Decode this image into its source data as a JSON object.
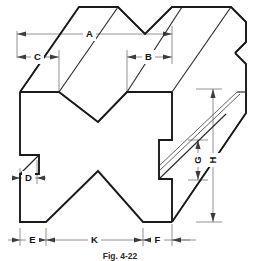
{
  "figure": {
    "kind": "isometric-technical-drawing",
    "caption": "Fig. 4-22",
    "colors": {
      "outline": "#1a1a1a",
      "interior_edge": "#2b2b2b",
      "dimension_line": "#6f6f6f",
      "label_text": "#111111",
      "background": "#ffffff"
    },
    "dimension_labels": [
      {
        "id": "A",
        "label": "A",
        "orientation": "horizontal",
        "location": "top, overall width of upper-left face"
      },
      {
        "id": "B",
        "label": "B",
        "orientation": "horizontal",
        "location": "top, right-hand partial width"
      },
      {
        "id": "C",
        "label": "C",
        "orientation": "horizontal",
        "location": "top, left-hand partial width"
      },
      {
        "id": "D",
        "label": "D",
        "orientation": "horizontal",
        "location": "left side, small notch width"
      },
      {
        "id": "E",
        "label": "E",
        "orientation": "horizontal",
        "location": "bottom, left segment"
      },
      {
        "id": "F",
        "label": "F",
        "orientation": "horizontal",
        "location": "bottom, right segment"
      },
      {
        "id": "G",
        "label": "G",
        "orientation": "vertical",
        "location": "right side, inner slot height"
      },
      {
        "id": "H",
        "label": "H",
        "orientation": "vertical",
        "location": "right side, overall height"
      },
      {
        "id": "K",
        "label": "K",
        "orientation": "horizontal",
        "location": "bottom, center segment"
      }
    ]
  }
}
